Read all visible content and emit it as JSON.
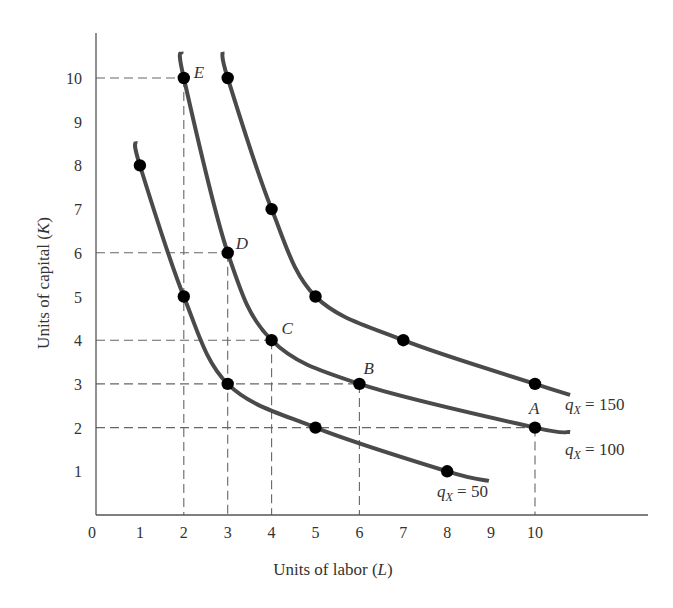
{
  "chart_data": {
    "type": "line",
    "title": "",
    "xlabel": "Units of labor",
    "xlabel_var": "L",
    "ylabel": "Units of capital",
    "ylabel_var": "K",
    "xlim": [
      0,
      11.5
    ],
    "ylim": [
      0,
      11
    ],
    "x_ticks": [
      0,
      1,
      2,
      3,
      4,
      5,
      6,
      7,
      8,
      9,
      10
    ],
    "y_ticks": [
      1,
      2,
      3,
      4,
      5,
      6,
      7,
      8,
      9,
      10
    ],
    "grid": false,
    "legend": "inline curve labels",
    "series": [
      {
        "name": "qX = 50",
        "label_q": "q",
        "label_sub": "X",
        "label_rest": " = 50",
        "points": [
          [
            1,
            8
          ],
          [
            2,
            5
          ],
          [
            3,
            3
          ],
          [
            5,
            2
          ],
          [
            8,
            1
          ]
        ],
        "curve_start": [
          0.9,
          8.55
        ],
        "curve_end": [
          8.95,
          0.78
        ]
      },
      {
        "name": "qX = 100",
        "label_q": "q",
        "label_sub": "X",
        "label_rest": " = 100",
        "points": [
          [
            2,
            10
          ],
          [
            3,
            6
          ],
          [
            4,
            4
          ],
          [
            6,
            3
          ],
          [
            10,
            2
          ]
        ],
        "curve_start": [
          1.95,
          10.6
        ],
        "curve_end": [
          10.8,
          1.9
        ]
      },
      {
        "name": "qX = 150",
        "label_q": "q",
        "label_sub": "X",
        "label_rest": " = 150",
        "points": [
          [
            3,
            10
          ],
          [
            4,
            7
          ],
          [
            5,
            5
          ],
          [
            7,
            4
          ],
          [
            10,
            3
          ]
        ],
        "curve_start": [
          2.88,
          10.6
        ],
        "curve_end": [
          10.8,
          2.75
        ]
      }
    ],
    "annotations": [
      {
        "label": "A",
        "x": 10,
        "y": 2
      },
      {
        "label": "B",
        "x": 6,
        "y": 3
      },
      {
        "label": "C",
        "x": 4,
        "y": 4
      },
      {
        "label": "D",
        "x": 3,
        "y": 6
      },
      {
        "label": "E",
        "x": 2,
        "y": 10
      }
    ],
    "reference_lines": "dashed lines from each lettered point to both axes"
  },
  "colors": {
    "curve": "#4a4a4a",
    "point": "#000000",
    "axis": "#555555",
    "dash": "#666666",
    "text": "#333333"
  }
}
